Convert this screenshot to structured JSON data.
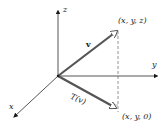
{
  "diagram": {
    "type": "3d-projection",
    "axes": {
      "z": {
        "label": "z"
      },
      "y": {
        "label": "y"
      },
      "x": {
        "label": "x"
      }
    },
    "vectors": {
      "v": {
        "label": "v",
        "endpoint_label": "(x, y, z)"
      },
      "Tv": {
        "label": "T(v)",
        "endpoint_label": "(x, y, 0)"
      }
    },
    "colors": {
      "axis": "#2a2a2a",
      "vector": "#555555",
      "dashed": "#666666",
      "text": "#1a1a1a"
    }
  }
}
